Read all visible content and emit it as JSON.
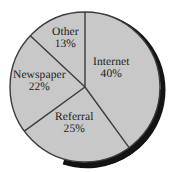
{
  "chart_data": {
    "type": "pie",
    "title": "",
    "subtitle": "",
    "xlabel": "",
    "ylabel": "",
    "legend_position": "none",
    "grid": false,
    "labels_inside": true,
    "start_angle_deg": 0,
    "direction": "clockwise",
    "categories": [
      "Internet",
      "Referral",
      "Newspaper",
      "Other"
    ],
    "values": [
      40,
      25,
      22,
      13
    ],
    "value_suffix": "%",
    "total": 100,
    "slices": [
      {
        "name": "Internet",
        "value": 40,
        "value_label": "40%",
        "color": "#c8c8c8",
        "start_deg": 0,
        "end_deg": 144
      },
      {
        "name": "Referral",
        "value": 25,
        "value_label": "25%",
        "color": "#c8c8c8",
        "start_deg": 144,
        "end_deg": 234
      },
      {
        "name": "Newspaper",
        "value": 22,
        "value_label": "22%",
        "color": "#c8c8c8",
        "start_deg": 234,
        "end_deg": 313.2
      },
      {
        "name": "Other",
        "value": 13,
        "value_label": "13%",
        "color": "#c8c8c8",
        "start_deg": 313.2,
        "end_deg": 360
      }
    ]
  },
  "style": {
    "background": "#ffffff",
    "slice_fill": "#c8c8c8",
    "slice_stroke": "#3b3b3b",
    "shadow_color": "#111111",
    "text_color": "#1a1a1a"
  }
}
